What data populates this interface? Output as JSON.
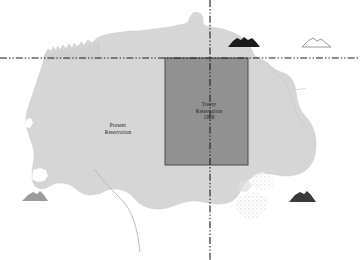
{
  "figure": {
    "name": "reservation-map",
    "width": 360,
    "height": 260,
    "background_color": "#ffffff"
  },
  "labels": {
    "present_reservation": "Present\nReservation",
    "treaty_reservation": "Treaty\nReservation\n1868"
  },
  "regions": [
    {
      "name": "present-reservation-area",
      "label": "Present Reservation",
      "fill_color": "#d6d6d6",
      "stroke_color": "#c2c2c2"
    },
    {
      "name": "treaty-reservation-1868-area",
      "label": "Treaty Reservation 1868",
      "year": "1868",
      "fill_color": "#8b8b8b",
      "stroke_color": "#4a4a4a"
    }
  ],
  "boundary_lines": [
    {
      "name": "horizontal-boundary-line",
      "orientation": "horizontal",
      "style": "dash-dot-dot",
      "color": "#1c1c1c",
      "y": 58
    },
    {
      "name": "vertical-boundary-line",
      "orientation": "vertical",
      "style": "dash-dot-dot",
      "color": "#1c1c1c",
      "x": 210
    }
  ],
  "butte_symbols": [
    {
      "name": "butte-symbol-north-filled",
      "fill_color": "#1a1a1a",
      "style": "filled"
    },
    {
      "name": "butte-symbol-north-outline",
      "fill_color": "#ffffff",
      "stroke_color": "#8a8a8a",
      "style": "outline"
    },
    {
      "name": "butte-symbol-southwest",
      "fill_color": "#9a9a9a",
      "style": "filled"
    },
    {
      "name": "butte-symbol-southeast",
      "fill_color": "#3a3a3a",
      "style": "filled"
    }
  ],
  "rivers": [
    {
      "name": "river-southwest",
      "color": "#b5b5b5"
    },
    {
      "name": "river-northeast",
      "color": "#cfcfcf"
    }
  ]
}
